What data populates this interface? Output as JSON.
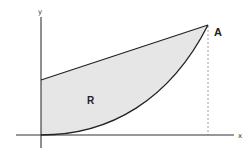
{
  "diagram": {
    "type": "region-between-curves",
    "axes": {
      "x_label": "x",
      "y_label": "y"
    },
    "region": {
      "label": "R",
      "fill": "#e6e6e6"
    },
    "upper_boundary": {
      "kind": "straight-line",
      "from": "y-intercept",
      "to": "A"
    },
    "lower_boundary": {
      "kind": "curve",
      "from": "origin",
      "to": "A"
    },
    "intersection_point": {
      "label": "A"
    },
    "guide_line": {
      "kind": "dashed-vertical",
      "from": "A",
      "to": "x-axis"
    },
    "colors": {
      "stroke": "#222222",
      "axis": "#333333",
      "dashed": "#888888",
      "fill": "#e6e6e6"
    }
  }
}
